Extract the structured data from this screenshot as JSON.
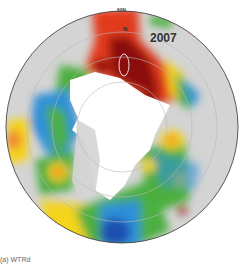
{
  "map": {
    "year_label": "2007",
    "latitude_label": "60N",
    "north_label": "N",
    "caption": "(a) WTRd"
  },
  "colors": {
    "land": "#d4d4d4",
    "ice": "#ffffff",
    "high": "#8b0a0a",
    "warm": "#e23a1a",
    "mid": "#f5d41b",
    "cool": "#4caf3f",
    "low": "#2f8fd8",
    "lowest": "#1f4fb0"
  }
}
